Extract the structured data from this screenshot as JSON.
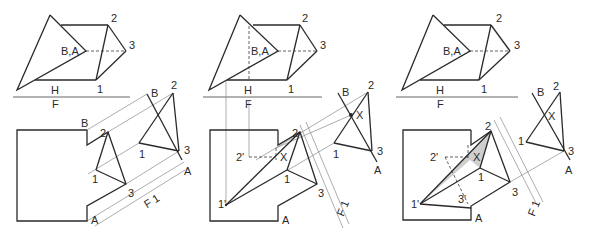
{
  "figure": {
    "panels": [
      {
        "id": "step-1",
        "top_view": {
          "labels": {
            "ba": "B,A",
            "p2": "2",
            "p3": "3",
            "p1": "1",
            "h": "H",
            "f": "F"
          }
        },
        "front_view": {
          "labels": {
            "b": "B",
            "p2": "2",
            "p1": "1",
            "p3": "3",
            "a": "A"
          }
        },
        "aux_view": {
          "labels": {
            "b": "B",
            "p2": "2",
            "p1": "1",
            "p3": "3",
            "a": "A",
            "f1": "F 1"
          }
        }
      },
      {
        "id": "step-2",
        "top_view": {
          "labels": {
            "ba": "B,A",
            "p2": "2",
            "p3": "3",
            "p1": "1",
            "h": "H",
            "f": "F"
          }
        },
        "front_view": {
          "labels": {
            "p2": "2",
            "p2prime": "2'",
            "x": "X",
            "p1": "1",
            "p1prime": "1'",
            "p3": "3",
            "a": "A"
          }
        },
        "aux_view": {
          "labels": {
            "b": "B",
            "p2": "2",
            "x": "X",
            "p1": "1",
            "p3": "3",
            "a": "A",
            "f1": "F 1"
          }
        }
      },
      {
        "id": "step-3",
        "top_view": {
          "labels": {
            "ba": "B,A",
            "p2": "2",
            "p3": "3",
            "p1": "1",
            "h": "H",
            "f": "F"
          }
        },
        "front_view": {
          "labels": {
            "p2": "2",
            "p2prime": "2'",
            "x": "X",
            "p1": "1",
            "p1prime": "1'",
            "p3": "3",
            "p3prime": "3'",
            "a": "A"
          }
        },
        "aux_view": {
          "labels": {
            "b": "B",
            "p2": "2",
            "x": "X",
            "p1": "1",
            "p3": "3",
            "a": "A",
            "f1": "F 1"
          }
        }
      }
    ],
    "colors": {
      "line": "#2a2a2a",
      "projection": "#8a8a8a",
      "shade": "#cfcfcf",
      "background": "#ffffff"
    }
  }
}
